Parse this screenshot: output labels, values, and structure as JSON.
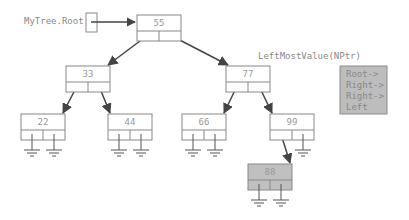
{
  "root_pointer": {
    "label": "MyTree.Root"
  },
  "nodes": [
    {
      "id": "n55",
      "value": "55",
      "x": 137,
      "y": 15,
      "highlight": false
    },
    {
      "id": "n33",
      "value": "33",
      "x": 66,
      "y": 66,
      "highlight": false
    },
    {
      "id": "n77",
      "value": "77",
      "x": 226,
      "y": 66,
      "highlight": false
    },
    {
      "id": "n22",
      "value": "22",
      "x": 21,
      "y": 114,
      "highlight": false
    },
    {
      "id": "n44",
      "value": "44",
      "x": 108,
      "y": 114,
      "highlight": false
    },
    {
      "id": "n66",
      "value": "66",
      "x": 182,
      "y": 114,
      "highlight": false
    },
    {
      "id": "n99",
      "value": "99",
      "x": 270,
      "y": 114,
      "highlight": false
    },
    {
      "id": "n88",
      "value": "88",
      "x": 248,
      "y": 164,
      "highlight": true
    }
  ],
  "edges": [
    [
      "n55",
      "left",
      "n33"
    ],
    [
      "n55",
      "right",
      "n77"
    ],
    [
      "n33",
      "left",
      "n22"
    ],
    [
      "n33",
      "right",
      "n44"
    ],
    [
      "n77",
      "left",
      "n66"
    ],
    [
      "n77",
      "right",
      "n99"
    ],
    [
      "n99",
      "left",
      "n88"
    ]
  ],
  "function_call": {
    "title": "LeftMostValue(NPtr)",
    "lines": [
      "Root->",
      "Right->",
      "Right->",
      "Left"
    ]
  },
  "colors": {
    "line": "#555555",
    "node_border": "#888888",
    "highlight_fill": "#c0c0c0",
    "panel_fill": "#bdbdbd"
  }
}
